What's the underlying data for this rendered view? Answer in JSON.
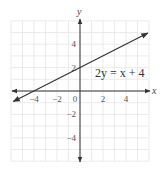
{
  "chart_data": {
    "type": "line",
    "title": "",
    "xlabel": "x",
    "ylabel": "y",
    "xlim": [
      -6,
      6
    ],
    "ylim": [
      -6,
      6
    ],
    "grid": true,
    "x_ticks": [
      -4,
      -2,
      0,
      2,
      4
    ],
    "y_ticks": [
      4,
      2,
      -2,
      -4
    ],
    "x_tick_labels": [
      "−4",
      "−2",
      "0",
      "2",
      "4"
    ],
    "y_tick_labels": [
      "4",
      "2",
      "−2",
      "−4"
    ],
    "series": [
      {
        "name": "2y = x + 4",
        "equation": "2y = x + 4",
        "slope": 0.5,
        "intercept": 2,
        "x": [
          -5.8,
          5.9
        ],
        "y": [
          -0.9,
          4.95
        ],
        "arrows": "both"
      }
    ],
    "annotations": [
      {
        "text": "2y = x + 4",
        "x": 1.3,
        "y": 1.7
      }
    ]
  },
  "colors": {
    "grid": "#e6e6e6",
    "axis": "#333333",
    "line": "#333333",
    "text": "#444444"
  }
}
